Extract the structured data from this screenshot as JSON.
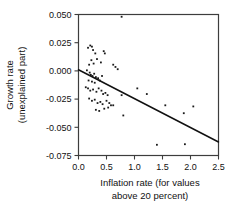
{
  "chart_data": {
    "type": "scatter",
    "title": "",
    "xlabel": "Inflation rate (for values above 20 percent)",
    "xlabel_line1": "Inflation rate (for values",
    "xlabel_line2": "above 20 percent)",
    "ylabel": "Growth rate (unexplained part)",
    "ylabel_line1": "Growth rate",
    "ylabel_line2": "(unexplained part)",
    "xlim": [
      0.0,
      2.5
    ],
    "ylim": [
      -0.075,
      0.05
    ],
    "xticks": [
      0.0,
      0.5,
      1.0,
      1.5,
      2.0,
      2.5
    ],
    "xtick_labels": [
      "0.0",
      "0.5",
      "1.0",
      "1.5",
      "2.0",
      "2.5"
    ],
    "yticks": [
      0.05,
      0.025,
      0.0,
      -0.025,
      -0.05,
      -0.075
    ],
    "ytick_labels": [
      "0.050",
      "0.025",
      "0.000",
      "-0.025",
      "-0.050",
      "-0.075"
    ],
    "grid": false,
    "legend": "none",
    "marker_color": "#1a1a1a",
    "line_color": "#111111",
    "axis_color": "#3d3d3d",
    "fit_line": {
      "name": "regression line",
      "x": [
        0.0,
        2.5
      ],
      "y": [
        0.001,
        -0.063
      ],
      "slope": -0.0256,
      "intercept": 0.001
    },
    "series": [
      {
        "name": "countries",
        "n_points": 55,
        "points": [
          [
            0.17,
            0.0205
          ],
          [
            0.21,
            0.0225
          ],
          [
            0.24,
            0.0215
          ],
          [
            0.26,
            0.0185
          ],
          [
            0.3,
            0.0155
          ],
          [
            0.23,
            0.0095
          ],
          [
            0.19,
            0.0055
          ],
          [
            0.27,
            0.0065
          ],
          [
            0.33,
            0.0105
          ],
          [
            0.4,
            0.0075
          ],
          [
            0.45,
            0.0175
          ],
          [
            0.47,
            0.0155
          ],
          [
            0.77,
            0.048
          ],
          [
            0.62,
            0.0055
          ],
          [
            0.66,
            0.0035
          ],
          [
            0.7,
            0.0015
          ],
          [
            0.15,
            0.0005
          ],
          [
            0.2,
            -0.0015
          ],
          [
            0.22,
            -0.0035
          ],
          [
            0.25,
            -0.0045
          ],
          [
            0.28,
            -0.0025
          ],
          [
            0.31,
            -0.0055
          ],
          [
            0.18,
            -0.0085
          ],
          [
            0.24,
            -0.0095
          ],
          [
            0.29,
            -0.0105
          ],
          [
            0.35,
            -0.0065
          ],
          [
            0.38,
            -0.0085
          ],
          [
            0.42,
            -0.0045
          ],
          [
            0.13,
            -0.0145
          ],
          [
            0.17,
            -0.0155
          ],
          [
            0.21,
            -0.0175
          ],
          [
            0.26,
            -0.0165
          ],
          [
            0.32,
            -0.0185
          ],
          [
            0.36,
            -0.0155
          ],
          [
            0.41,
            -0.0175
          ],
          [
            0.44,
            -0.0205
          ],
          [
            0.48,
            -0.0195
          ],
          [
            0.52,
            -0.0215
          ],
          [
            0.19,
            -0.0245
          ],
          [
            0.24,
            -0.0265
          ],
          [
            0.29,
            -0.0255
          ],
          [
            0.34,
            -0.0285
          ],
          [
            0.39,
            -0.0275
          ],
          [
            0.43,
            -0.0295
          ],
          [
            0.5,
            -0.0265
          ],
          [
            0.55,
            -0.0285
          ],
          [
            0.58,
            -0.0305
          ],
          [
            0.62,
            -0.0305
          ],
          [
            0.31,
            -0.0345
          ],
          [
            0.37,
            -0.0355
          ],
          [
            0.46,
            -0.0335
          ],
          [
            0.53,
            -0.0325
          ],
          [
            0.77,
            -0.0215
          ],
          [
            1.05,
            -0.0155
          ],
          [
            1.22,
            -0.0205
          ],
          [
            1.55,
            -0.0305
          ],
          [
            1.88,
            -0.0375
          ],
          [
            2.05,
            -0.0315
          ],
          [
            0.8,
            -0.0395
          ],
          [
            1.4,
            -0.0655
          ],
          [
            1.9,
            -0.065
          ]
        ]
      }
    ]
  }
}
